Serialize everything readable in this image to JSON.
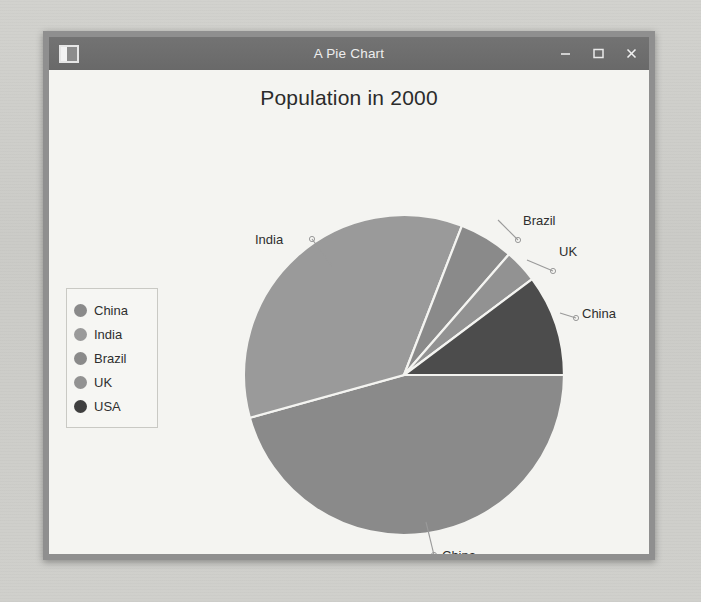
{
  "window": {
    "title": "A Pie Chart",
    "icon": "window-icon",
    "controls": [
      {
        "name": "minimize",
        "glyph": "minus-icon",
        "label": "–"
      },
      {
        "name": "maximize",
        "glyph": "square-icon",
        "label": "❐"
      },
      {
        "name": "close",
        "glyph": "close-icon",
        "label": "×"
      }
    ]
  },
  "chart_data": {
    "type": "pie",
    "title": "Population in 2000",
    "xlabel": "",
    "ylabel": "",
    "categories": [
      "China",
      "India",
      "Brazil",
      "UK",
      "USA"
    ],
    "values": [
      45.7,
      35.2,
      5.5,
      3.4,
      10.2
    ],
    "unit": "percent",
    "start_angle_deg": 0,
    "direction": "counterclockwise",
    "slice_angles_deg": [
      {
        "label": "China",
        "start": 195.5,
        "end": 360.0,
        "sweep": 164.5
      },
      {
        "label": "India",
        "start": 68.8,
        "end": 195.5,
        "sweep": 126.7
      },
      {
        "label": "Brazil",
        "start": 49.0,
        "end": 68.8,
        "sweep": 19.8
      },
      {
        "label": "UK",
        "start": 36.8,
        "end": 49.0,
        "sweep": 12.2
      },
      {
        "label": "USA",
        "start": 0.0,
        "end": 36.8,
        "sweep": 36.8
      }
    ],
    "colors": {
      "China": "#8a8a8a",
      "India": "#9a9a9a",
      "Brazil": "#8a8a8a",
      "UK": "#929292",
      "USA": "#4c4c4c"
    },
    "slice_border_color": "#f4f4f1",
    "legend_position": "left",
    "grid": false,
    "labels_outside": true,
    "callout_labels": [
      "India",
      "Brazil",
      "UK",
      "USA",
      "China"
    ]
  },
  "legend": {
    "items": [
      {
        "label": "China",
        "color": "#8a8a8a"
      },
      {
        "label": "India",
        "color": "#9a9a9a"
      },
      {
        "label": "Brazil",
        "color": "#8a8a8a"
      },
      {
        "label": "UK",
        "color": "#929292"
      },
      {
        "label": "USA",
        "color": "#3f3f3f"
      }
    ]
  },
  "callouts": {
    "india": "India",
    "brazil": "Brazil",
    "uk": "UK",
    "usa": "USA",
    "china": "China"
  },
  "background_text": {
    "line1": "the i  t  an  .  t",
    "line2": "nor  t  e  a  ber",
    "line3": "on  exa  pl",
    "line4": "A  n  b"
  }
}
